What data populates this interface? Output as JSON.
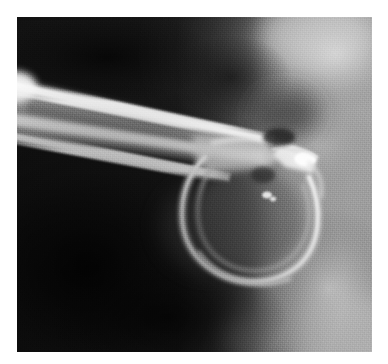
{
  "page": {
    "background_color": "#ffffff",
    "width": 388,
    "height": 364
  },
  "figure": {
    "name": "radiograph",
    "modality": "x-ray",
    "palette": "grayscale",
    "plate": {
      "x": 17,
      "y": 17,
      "width": 355,
      "height": 335,
      "background_color": "#161616",
      "border_color": "#ffffff"
    },
    "tones": {
      "background_dark": "#141414",
      "deep_black": "#0b0b0b",
      "soft_tissue_mid": "#8f8f8f",
      "soft_tissue_light": "#b4b4b4",
      "soft_tissue_bright": "#c9c9c9",
      "cortex_bright": "#eaeaea",
      "cortex_peak": "#fbfbfb",
      "marrow_gray": "#7a7a7a",
      "loop_gray": "#6f6f6f"
    },
    "regions": [
      {
        "name": "dark-background-field",
        "description": "Near-black radiolucent field filling the left and lower portion of the plate.",
        "tone": "#141414"
      },
      {
        "name": "soft-tissue-right-column",
        "description": "Broad vertical band of mid-gray soft tissue occupying the right third of the plate.",
        "tone": "#9c9c9c"
      },
      {
        "name": "soft-tissue-upper-right-bloom",
        "description": "Brighter diffuse soft-tissue bloom in the upper right corner.",
        "tone": "#c4c4c4"
      },
      {
        "name": "soft-tissue-lower-right-bloom",
        "description": "Brighter diffuse soft-tissue region in the lower right quadrant.",
        "tone": "#b8b8b8"
      }
    ],
    "structures": [
      {
        "name": "bone-shaft",
        "description": "Elongated tubular bone shaft entering from upper-left, angled down-right toward the centre of the plate; bright cortical margins bracket a darker medullary canal.",
        "tone": "#ecebe9"
      },
      {
        "name": "cortical-margin-superior",
        "description": "Upper bright cortical line of the shaft.",
        "tone": "#f6f6f6"
      },
      {
        "name": "cortical-margin-inferior",
        "description": "Lower bright cortical line of the shaft.",
        "tone": "#e6e6e6"
      },
      {
        "name": "medullary-canal",
        "description": "Darker gray marrow space between the two cortical lines.",
        "tone": "#7d7d7d"
      },
      {
        "name": "distal-loop-ring",
        "description": "Large rounded loop/ring of bright density at the distal end of the shaft, curving down and back to the left.",
        "tone": "#d8d8d8"
      },
      {
        "name": "loop-outer-arc",
        "description": "Outer bright arc of the ring structure.",
        "tone": "#ddd"
      },
      {
        "name": "loop-inner-arc",
        "description": "Inner, fainter concentric arc within the ring.",
        "tone": "#c6c6c6"
      },
      {
        "name": "convergence-node",
        "description": "Bright wedge-shaped convergence where the shaft, the loop and a thin strut meet at the right of the structure.",
        "tone": "#f2f2f2"
      },
      {
        "name": "thin-strut",
        "description": "Narrow bright linear strut running right-downward from the convergence node.",
        "tone": "#e0e0e0"
      },
      {
        "name": "dense-focus-spot",
        "description": "Small very bright punctate density inside the loop, just right of centre.",
        "tone": "#ffffff"
      },
      {
        "name": "dark-notch",
        "description": "Small dark lucency immediately above the convergence node.",
        "tone": "#2a2a2a"
      }
    ],
    "annotations": [],
    "caption": ""
  }
}
